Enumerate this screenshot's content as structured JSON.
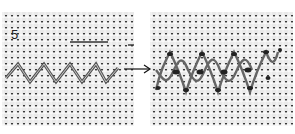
{
  "figure": {
    "step_number": "5",
    "left_panel": {
      "description": "zigzag stitch worked on evenweave fabric"
    },
    "right_panel": {
      "description": "completed interlaced zigzag stitch"
    },
    "arrow": {
      "direction": "right"
    }
  },
  "colors": {
    "fabric": "#e9e9e9",
    "thread": "#444444",
    "background": "#ffffff"
  }
}
